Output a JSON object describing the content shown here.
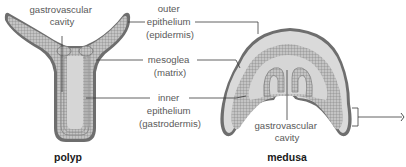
{
  "diagram": {
    "forms": [
      {
        "id": "polyp",
        "title": "polyp",
        "internal_label": [
          "gastrovascular",
          "cavity"
        ]
      },
      {
        "id": "medusa",
        "title": "medusa",
        "internal_label": [
          "gastrovascular",
          "cavity"
        ]
      }
    ],
    "layer_labels": [
      {
        "id": "outer-epithelium",
        "lines": [
          "outer",
          "epithelium",
          "(epidermis)"
        ]
      },
      {
        "id": "mesoglea",
        "lines": [
          "mesoglea",
          "(matrix)"
        ]
      },
      {
        "id": "inner-epithelium",
        "lines": [
          "inner",
          "epithelium",
          "(gastrodermis)"
        ]
      }
    ],
    "colors": {
      "outer_epithelium": "#6e6e6e",
      "mesoglea": "#dadada",
      "inner_epithelium": "#bdbdbd",
      "cavity": "#d6d6d6",
      "leader_line": "#3a3a3a",
      "label_text": "#5a5a5a"
    }
  }
}
